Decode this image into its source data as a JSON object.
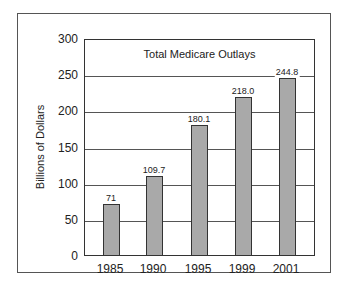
{
  "chart_data": {
    "type": "bar",
    "title": "Total Medicare Outlays",
    "xlabel": "",
    "ylabel": "Billions of Dollars",
    "categories": [
      "1985",
      "1990",
      "1995",
      "1999",
      "2001"
    ],
    "values": [
      71,
      109.7,
      180.1,
      218.0,
      244.8
    ],
    "value_labels": [
      "71",
      "109.7",
      "180.1",
      "218.0",
      "244.8"
    ],
    "ylim": [
      0,
      300
    ],
    "yticks": [
      "0",
      "50",
      "100",
      "150",
      "200",
      "250",
      "300"
    ],
    "grid": true,
    "legend": null,
    "bar_color": "#a9a9a9"
  }
}
